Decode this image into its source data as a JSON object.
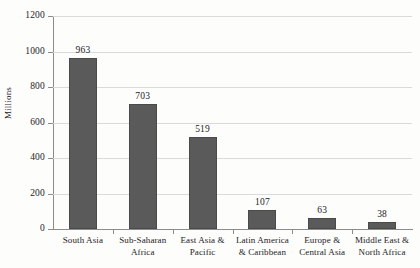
{
  "chart_data": {
    "type": "bar",
    "title": "",
    "xlabel": "",
    "ylabel": "Millions",
    "ylim": [
      0,
      1200
    ],
    "ytick_step": 200,
    "yticks": [
      "0",
      "200",
      "400",
      "600",
      "800",
      "1000",
      "1200"
    ],
    "grid": true,
    "legend": null,
    "bar_color": "#5a5a5a",
    "background_color": "#fdfdfc",
    "gridline_color": "#dadada",
    "axis_color": "#8c8c8c",
    "categories": [
      "South Asia",
      "Sub-Saharan Africa",
      "East Asia & Pacific",
      "Latin America & Caribbean",
      "Europe & Central Asia",
      "Middle East & North Africa"
    ],
    "category_lines": [
      [
        "South Asia",
        ""
      ],
      [
        "Sub-Saharan",
        "Africa"
      ],
      [
        "East Asia &",
        "Pacific"
      ],
      [
        "Latin America",
        "& Caribbean"
      ],
      [
        "Europe &",
        "Central Asia"
      ],
      [
        "Middle East &",
        "North Africa"
      ]
    ],
    "values": [
      963,
      703,
      519,
      107,
      63,
      38
    ],
    "value_labels": [
      "963",
      "703",
      "519",
      "107",
      "63",
      "38"
    ]
  }
}
